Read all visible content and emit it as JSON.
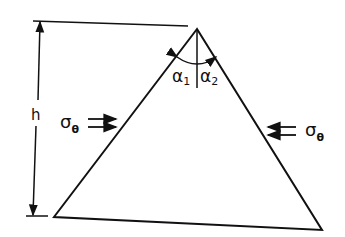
{
  "labels": {
    "height": "h",
    "alpha1": "α",
    "alpha1_sub": "1",
    "alpha2": "α",
    "alpha2_sub": "2",
    "sigma_left": "σ",
    "sigma_left_sub": "θ",
    "sigma_right": "σ",
    "sigma_right_sub": "θ"
  },
  "colors": {
    "stroke": "#111111",
    "background": "#ffffff"
  }
}
